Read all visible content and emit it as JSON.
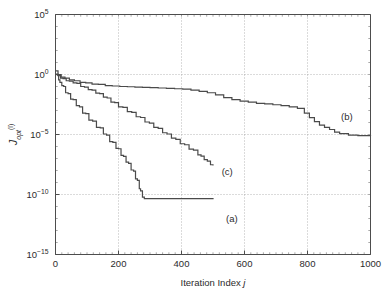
{
  "chart_data": {
    "type": "line",
    "title": "",
    "xlabel": "Iteration Index j",
    "ylabel": "J_opt^(l)",
    "ylabel_parts": {
      "base": "J",
      "sub": "opt",
      "sup": "(l)"
    },
    "xlim": [
      0,
      1000
    ],
    "ylim": [
      1e-15,
      100000.0
    ],
    "yscale": "log",
    "xscale": "linear",
    "grid": true,
    "legend": "inline-annotations",
    "xticks": [
      0,
      200,
      400,
      600,
      800,
      1000
    ],
    "xticklabels": [
      "0",
      "200",
      "400",
      "600",
      "800",
      "1000"
    ],
    "yticks": [
      100000.0,
      1.0,
      1e-05,
      1e-10,
      1e-15
    ],
    "yticklabels": [
      {
        "mantissa": "10",
        "exponent": "5"
      },
      {
        "mantissa": "10",
        "exponent": "0"
      },
      {
        "mantissa": "10",
        "exponent": "-5"
      },
      {
        "mantissa": "10",
        "exponent": "-10"
      },
      {
        "mantissa": "10",
        "exponent": "-15"
      }
    ],
    "annotations": [
      {
        "text": "(a)",
        "x": 560,
        "y": 1e-12
      },
      {
        "text": "(b)",
        "x": 925,
        "y": 0.0003
      },
      {
        "text": "(c)",
        "x": 545,
        "y": 8e-09
      }
    ],
    "series": [
      {
        "name": "(a)",
        "label": "(a)",
        "x": [
          0,
          6,
          10,
          14,
          20,
          26,
          32,
          40,
          48,
          56,
          66,
          76,
          86,
          96,
          106,
          118,
          130,
          142,
          152,
          162,
          172,
          182,
          192,
          200,
          208,
          216,
          224,
          232,
          240,
          248,
          254,
          260,
          266,
          270,
          276,
          282,
          500
        ],
        "y": [
          1.0,
          0.9,
          0.35,
          0.22,
          0.12,
          0.1,
          0.03,
          0.025,
          0.009,
          0.008,
          0.0025,
          0.002,
          0.0006,
          0.00055,
          0.00016,
          0.00013,
          4e-05,
          3.5e-05,
          1.1e-05,
          9e-06,
          2.5e-06,
          2.2e-06,
          7e-07,
          6.5e-07,
          1.8e-07,
          1.5e-07,
          5e-08,
          4e-08,
          1.1e-08,
          9e-09,
          2e-09,
          1.5e-09,
          3e-10,
          2e-10,
          6e-11,
          4.5e-11,
          4e-11
        ]
      },
      {
        "name": "(c)",
        "label": "(c)",
        "x": [
          0,
          8,
          16,
          24,
          34,
          44,
          56,
          68,
          80,
          92,
          104,
          116,
          128,
          140,
          152,
          164,
          176,
          188,
          200,
          214,
          228,
          242,
          256,
          270,
          284,
          298,
          312,
          326,
          340,
          354,
          368,
          382,
          396,
          410,
          424,
          438,
          452,
          462,
          472,
          482,
          492,
          500
        ],
        "y": [
          1.1,
          0.8,
          0.5,
          0.45,
          0.3,
          0.28,
          0.2,
          0.18,
          0.1,
          0.09,
          0.055,
          0.05,
          0.028,
          0.025,
          0.013,
          0.011,
          0.005,
          0.0045,
          0.002,
          0.0018,
          0.0008,
          0.0007,
          0.0003,
          0.00026,
          0.00011,
          9e-05,
          4e-05,
          3.2e-05,
          1.4e-05,
          1.1e-05,
          5e-06,
          4e-06,
          1.7e-06,
          1.4e-06,
          6e-07,
          5e-07,
          2e-07,
          1.6e-07,
          8e-08,
          6e-08,
          3e-08,
          2.6e-08
        ]
      },
      {
        "name": "(b)",
        "label": "(b)",
        "x": [
          0,
          8,
          18,
          30,
          44,
          60,
          78,
          96,
          116,
          136,
          158,
          180,
          204,
          228,
          252,
          276,
          300,
          326,
          352,
          378,
          404,
          430,
          456,
          482,
          508,
          534,
          560,
          586,
          612,
          638,
          664,
          690,
          716,
          742,
          768,
          790,
          806,
          822,
          838,
          854,
          870,
          886,
          902,
          930,
          960,
          1000
        ],
        "y": [
          2.0,
          1.0,
          0.6,
          0.5,
          0.35,
          0.3,
          0.22,
          0.2,
          0.16,
          0.15,
          0.12,
          0.11,
          0.1,
          0.095,
          0.09,
          0.085,
          0.08,
          0.075,
          0.07,
          0.065,
          0.06,
          0.05,
          0.04,
          0.03,
          0.02,
          0.012,
          0.008,
          0.006,
          0.005,
          0.004,
          0.0035,
          0.003,
          0.0025,
          0.002,
          0.0015,
          0.0006,
          0.00025,
          0.00012,
          6e-05,
          4e-05,
          2.6e-05,
          1.6e-05,
          1.2e-05,
          9e-06,
          8e-06,
          7.5e-06
        ]
      }
    ],
    "colors": {
      "curve": "#4a4a4a",
      "axis": "#4d4d4d",
      "grid": "#9a9a9a",
      "background": "#ffffff"
    }
  }
}
